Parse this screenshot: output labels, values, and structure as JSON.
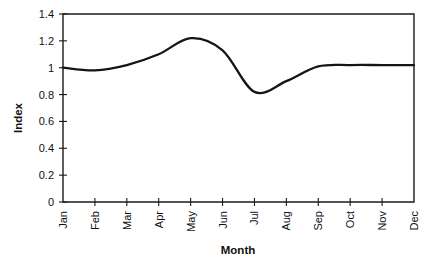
{
  "chart_data": {
    "type": "line",
    "title": "",
    "xlabel": "Month",
    "ylabel": "Index",
    "categories": [
      "Jan",
      "Feb",
      "Mar",
      "Apr",
      "May",
      "Jun",
      "Jul",
      "Aug",
      "Sep",
      "Oct",
      "Nov",
      "Dec"
    ],
    "values": [
      1.0,
      0.98,
      1.02,
      1.1,
      1.22,
      1.13,
      0.82,
      0.9,
      1.01,
      1.02,
      1.02,
      1.02
    ],
    "series": [
      {
        "name": "Index",
        "values": [
          1.0,
          0.98,
          1.02,
          1.1,
          1.22,
          1.13,
          0.82,
          0.9,
          1.01,
          1.02,
          1.02,
          1.02
        ]
      }
    ],
    "ylim": [
      0,
      1.4
    ],
    "ytick_labels": [
      "0",
      "0.2",
      "0.4",
      "0.6",
      "0.8",
      "1",
      "1.2",
      "1.4"
    ],
    "ytick_values": [
      0,
      0.2,
      0.4,
      0.6,
      0.8,
      1.0,
      1.2,
      1.4
    ],
    "grid": false,
    "legend": false,
    "legend_position": "none",
    "xtick_rotation": 90,
    "line_color": "#151515",
    "axis_color": "#1a1a1a",
    "background_color": "#ffffff"
  }
}
